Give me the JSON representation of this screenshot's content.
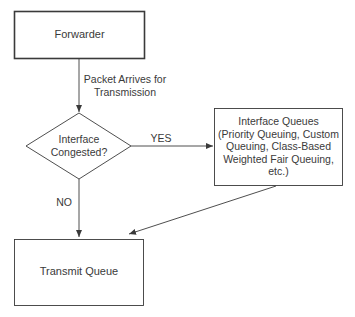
{
  "diagram": {
    "nodes": {
      "forwarder": {
        "label": "Forwarder",
        "shape": "rectangle"
      },
      "decision": {
        "label_line1": "Interface",
        "label_line2": "Congested?",
        "shape": "diamond"
      },
      "interface_queues": {
        "line1": "Interface Queues",
        "line2": "(Priority Queuing, Custom",
        "line3": "Queuing, Class-Based",
        "line4": "Weighted Fair Queuing,",
        "line5": "etc.)",
        "shape": "rectangle"
      },
      "transmit_queue": {
        "label": "Transmit Queue",
        "shape": "rectangle"
      }
    },
    "edges": {
      "forwarder_to_decision": {
        "label_line1": "Packet Arrives for",
        "label_line2": "Transmission"
      },
      "decision_yes": {
        "label": "YES"
      },
      "decision_no": {
        "label": "NO"
      },
      "queues_to_transmit": {
        "label": ""
      }
    },
    "colors": {
      "stroke": "#3a3a3a",
      "text": "#3a3a3a",
      "background": "#ffffff"
    }
  }
}
